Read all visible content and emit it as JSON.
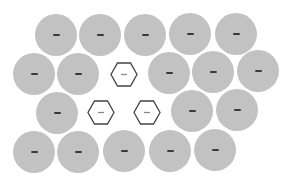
{
  "board": {
    "background": "#ffffff",
    "circle_fill": "#c2c2c2",
    "circle_mark": "#3a3a3a",
    "hex_stroke": "#444444",
    "hex_mark": "#8a8a8a",
    "cells": [
      {
        "shape": "circle",
        "row": 1,
        "col": 1,
        "cx": 56,
        "cy": 35,
        "mark": "dash"
      },
      {
        "shape": "circle",
        "row": 1,
        "col": 2,
        "cx": 100,
        "cy": 35,
        "mark": "dash"
      },
      {
        "shape": "circle",
        "row": 1,
        "col": 3,
        "cx": 145,
        "cy": 35,
        "mark": "dash"
      },
      {
        "shape": "circle",
        "row": 1,
        "col": 4,
        "cx": 190,
        "cy": 34,
        "mark": "dash"
      },
      {
        "shape": "circle",
        "row": 1,
        "col": 5,
        "cx": 236,
        "cy": 34,
        "mark": "dash"
      },
      {
        "shape": "circle",
        "row": 2,
        "col": 1,
        "cx": 34,
        "cy": 74,
        "mark": "dash"
      },
      {
        "shape": "circle",
        "row": 2,
        "col": 2,
        "cx": 78,
        "cy": 74,
        "mark": "dash"
      },
      {
        "shape": "hexagon",
        "row": 2,
        "col": 3,
        "cx": 124,
        "cy": 74,
        "mark": "dash"
      },
      {
        "shape": "circle",
        "row": 2,
        "col": 4,
        "cx": 169,
        "cy": 73,
        "mark": "dash"
      },
      {
        "shape": "circle",
        "row": 2,
        "col": 5,
        "cx": 213,
        "cy": 72,
        "mark": "dash"
      },
      {
        "shape": "circle",
        "row": 2,
        "col": 6,
        "cx": 258,
        "cy": 71,
        "mark": "dash"
      },
      {
        "shape": "circle",
        "row": 3,
        "col": 1,
        "cx": 57,
        "cy": 113,
        "mark": "dash"
      },
      {
        "shape": "hexagon",
        "row": 3,
        "col": 2,
        "cx": 101,
        "cy": 112,
        "mark": "dash"
      },
      {
        "shape": "hexagon",
        "row": 3,
        "col": 3,
        "cx": 147,
        "cy": 112,
        "mark": "dash"
      },
      {
        "shape": "circle",
        "row": 3,
        "col": 4,
        "cx": 192,
        "cy": 111,
        "mark": "dash"
      },
      {
        "shape": "circle",
        "row": 3,
        "col": 5,
        "cx": 237,
        "cy": 110,
        "mark": "dash"
      },
      {
        "shape": "circle",
        "row": 4,
        "col": 1,
        "cx": 34,
        "cy": 152,
        "mark": "dash"
      },
      {
        "shape": "circle",
        "row": 4,
        "col": 2,
        "cx": 78,
        "cy": 152,
        "mark": "dash"
      },
      {
        "shape": "circle",
        "row": 4,
        "col": 3,
        "cx": 124,
        "cy": 151,
        "mark": "dash"
      },
      {
        "shape": "circle",
        "row": 4,
        "col": 4,
        "cx": 170,
        "cy": 151,
        "mark": "dash"
      },
      {
        "shape": "circle",
        "row": 4,
        "col": 5,
        "cx": 215,
        "cy": 150,
        "mark": "dash"
      }
    ]
  }
}
